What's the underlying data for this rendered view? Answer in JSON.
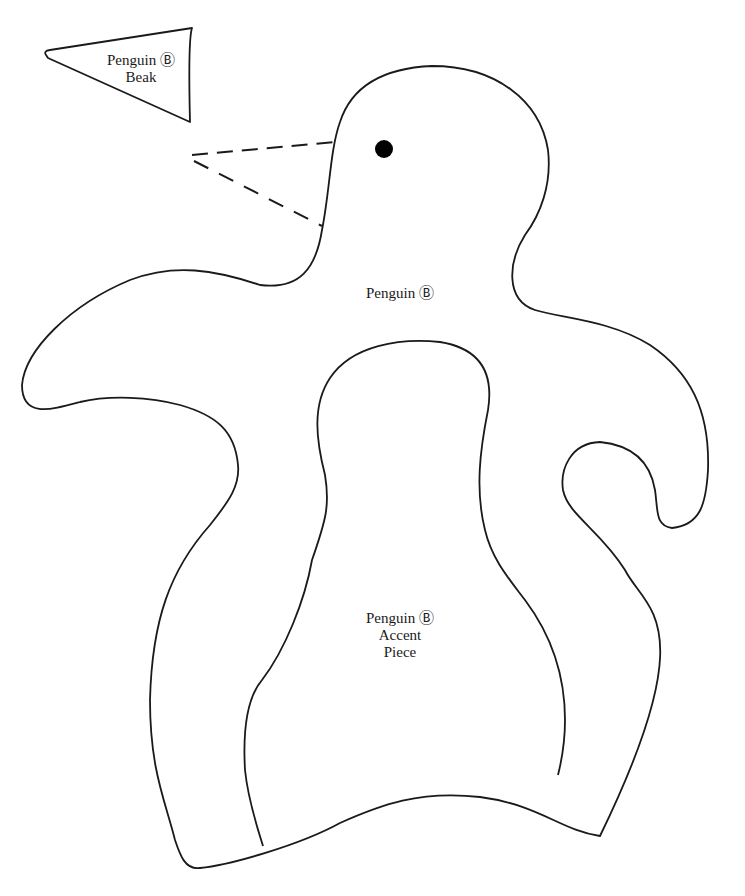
{
  "page": {
    "type": "sewing/craft pattern template",
    "background": "#ffffff",
    "line_color": "#1a1a1a"
  },
  "pieces": {
    "beak": {
      "label_line1": "Penguin Ⓑ",
      "label_line2": "Beak"
    },
    "body": {
      "label": "Penguin Ⓑ"
    },
    "accent": {
      "label_line1": "Penguin Ⓑ",
      "label_line2": "Accent",
      "label_line3": "Piece"
    }
  },
  "markers": {
    "eye": "filled-circle",
    "beak_placement": "dashed-triangle"
  }
}
